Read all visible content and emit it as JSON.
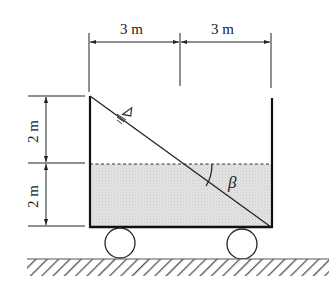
{
  "diagram": {
    "type": "tank-on-cart",
    "labels": {
      "top_left_width": "3 m",
      "top_right_width": "3 m",
      "left_upper_height": "2 m",
      "left_lower_height": "2 m",
      "angle": "β",
      "free_surface_symbol": "∇"
    },
    "colors": {
      "line": "#222222",
      "water_fill": "#dcdcdc",
      "hatch": "#555555",
      "background": "#ffffff"
    },
    "elements": {
      "tank": {
        "width_m": 6,
        "height_m": 4
      },
      "initial_water_level_m": 2,
      "tilted_surface": "from top-left corner to bottom-right corner",
      "wheels": 2,
      "ground": "hatched"
    }
  }
}
